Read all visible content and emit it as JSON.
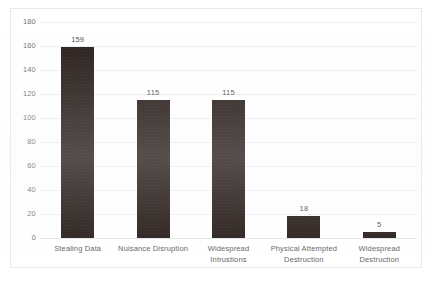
{
  "chart_data": {
    "type": "bar",
    "title": "",
    "subtitle": "",
    "xlabel": "",
    "ylabel": "",
    "categories": [
      "Stealing Data",
      "Nuisance Disruption",
      "Widespread Intrustions",
      "Physical Attempted Destruction",
      "Widespread Destruction"
    ],
    "category_lines": [
      [
        "Stealing Data"
      ],
      [
        "Nuisance Disruption"
      ],
      [
        "Widespread",
        "Intrustions"
      ],
      [
        "Physical Attempted",
        "Destruction"
      ],
      [
        "Widespread",
        "Destruction"
      ]
    ],
    "values": [
      159,
      115,
      115,
      18,
      5
    ],
    "data_labels": [
      "159",
      "115",
      "115",
      "18",
      "5"
    ],
    "ylim": [
      0,
      180
    ],
    "ytick_values": [
      0,
      20,
      40,
      60,
      80,
      100,
      120,
      140,
      160,
      180
    ],
    "ytick_labels": [
      "0",
      "20",
      "40",
      "60",
      "80",
      "100",
      "120",
      "140",
      "160",
      "180"
    ],
    "grid": "horizontal",
    "legend": "none",
    "bar_color": "#201512",
    "gridline_color": "#eceef0",
    "frame_color": "#e8e8e8",
    "label_color": "#5d5d5d"
  }
}
